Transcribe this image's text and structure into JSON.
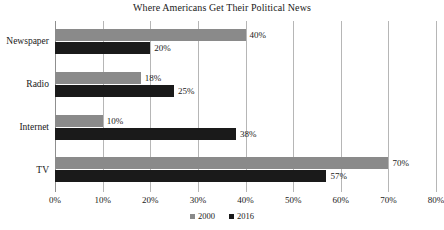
{
  "chart_data": {
    "type": "bar",
    "orientation": "horizontal",
    "title": "Where Americans Get Their Political News",
    "xlabel": "",
    "ylabel": "",
    "categories": [
      "Newspaper",
      "Radio",
      "Internet",
      "TV"
    ],
    "series": [
      {
        "name": "2000",
        "color": "#8a8a8a",
        "values": [
          40,
          18,
          10,
          70
        ],
        "labels": [
          "40%",
          "18%",
          "10%",
          "70%"
        ]
      },
      {
        "name": "2016",
        "color": "#1a1a1a",
        "values": [
          20,
          25,
          38,
          57
        ],
        "labels": [
          "20%",
          "25%",
          "38%",
          "57%"
        ]
      }
    ],
    "xlim": [
      0,
      80
    ],
    "xticks": [
      0,
      10,
      20,
      30,
      40,
      50,
      60,
      70,
      80
    ],
    "xtick_labels": [
      "0%",
      "10%",
      "20%",
      "30%",
      "40%",
      "50%",
      "60%",
      "70%",
      "80%"
    ],
    "grid": "vertical",
    "legend_position": "bottom-center",
    "gridline_color": "#b6b6b6",
    "axis_color": "#8f8f8f",
    "background": "#ffffff"
  }
}
